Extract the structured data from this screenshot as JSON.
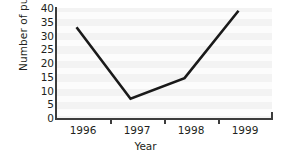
{
  "chart_data": {
    "type": "line",
    "title": "",
    "xlabel": "Year",
    "ylabel": "Number of pupils",
    "categories": [
      "1996",
      "1997",
      "1998",
      "1999"
    ],
    "x": [
      1996,
      1997,
      1998,
      1999
    ],
    "values": [
      33,
      7,
      14.5,
      39
    ],
    "series": [
      {
        "name": "Number of pupils",
        "values": [
          33,
          7,
          14.5,
          39
        ],
        "color": "#1a1a1a"
      }
    ],
    "ylim": [
      0,
      40
    ],
    "ytick_labels": [
      "0",
      "5",
      "10",
      "15",
      "20",
      "25",
      "30",
      "35",
      "40"
    ],
    "ytick_values": [
      0,
      5,
      10,
      15,
      20,
      25,
      30,
      35,
      40
    ],
    "xtick_labels": [
      "1996",
      "1997",
      "1998",
      "1999"
    ],
    "grid": false,
    "legend": "none",
    "plot_background": "#f3f3f3",
    "axis_color": "#3c3c3c",
    "line_color": "#1a1a1a"
  },
  "axes": {
    "y_title": "Number of pupils",
    "x_title": "Year"
  }
}
